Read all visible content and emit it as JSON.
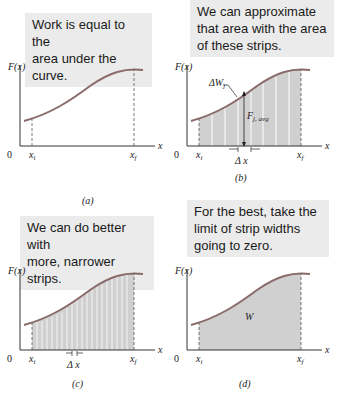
{
  "panels": [
    {
      "id": "a",
      "caption": "Work is equal to the area under the curve.",
      "caption_lines": [
        "Work is equal to the",
        "area under the curve."
      ],
      "label": "(a)",
      "y_label": "F(x)",
      "x_label": "x",
      "origin": "0",
      "xi": "x",
      "xi_sub": "i",
      "xf": "x",
      "xf_sub": "f"
    },
    {
      "id": "b",
      "caption": "We can approximate that area with the area of these strips.",
      "caption_lines": [
        "We can approximate",
        "that area with the area",
        "of these strips."
      ],
      "label": "(b)",
      "y_label": "F(x)",
      "x_label": "x",
      "origin": "0",
      "xi": "x",
      "xi_sub": "i",
      "xf": "x",
      "xf_sub": "f",
      "strip_label": "ΔW",
      "strip_label_sub": "j",
      "force_label": "F",
      "force_label_sub": "j, avg",
      "dx_label": "Δ x",
      "strip_count": 8
    },
    {
      "id": "c",
      "caption": "We can do better with more, narrower strips.",
      "caption_lines": [
        "We can do better with",
        "more, narrower strips."
      ],
      "label": "(c)",
      "y_label": "F(x)",
      "x_label": "x",
      "origin": "0",
      "xi": "x",
      "xi_sub": "i",
      "xf": "x",
      "xf_sub": "f",
      "dx_label": "Δ x",
      "strip_count": 20
    },
    {
      "id": "d",
      "caption": "For the best, take the limit of strip widths going to zero.",
      "caption_lines": [
        "For the best, take the",
        "limit of strip widths",
        "going to zero."
      ],
      "label": "(d)",
      "y_label": "F(x)",
      "x_label": "x",
      "origin": "0",
      "xi": "x",
      "xi_sub": "i",
      "xf": "x",
      "xf_sub": "f",
      "area_label": "W"
    }
  ],
  "colors": {
    "caption_bg": "#ebebeb",
    "curve": "#8a6a6a",
    "fill": "#d0d0d0",
    "axis": "#333333",
    "strip_line": "#ffffff"
  }
}
